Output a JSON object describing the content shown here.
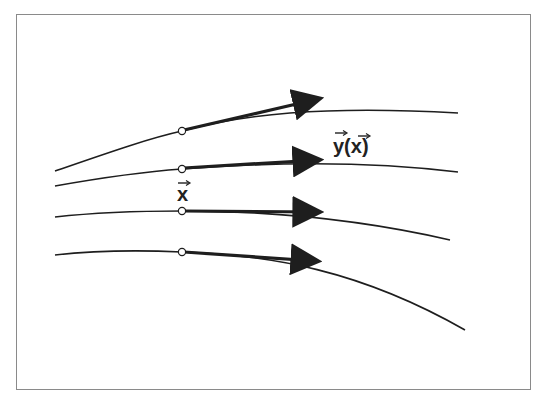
{
  "figure": {
    "labels": {
      "field_vector": "y(x)",
      "point": "x"
    },
    "colors": {
      "line": "#1e1e1e",
      "frame": "#8a8a8a",
      "background": "#ffffff"
    },
    "curves": [
      {
        "name": "curve-1",
        "path": "M55,171 C110,152 150,138 182,131 C240,115 320,105 458,113",
        "point": [
          182,
          131
        ],
        "arrow_tip": [
          334,
          96
        ]
      },
      {
        "name": "curve-2",
        "path": "M55,186 C100,178 140,172 182,169 C260,163 360,160 458,172",
        "point": [
          182,
          169
        ],
        "arrow_tip": [
          333,
          160
        ]
      },
      {
        "name": "curve-3",
        "path": "M55,217 C100,212 140,211 182,211 C260,211 350,217 450,240",
        "point": [
          182,
          211
        ],
        "arrow_tip": [
          333,
          212
        ]
      },
      {
        "name": "curve-4",
        "path": "M55,255 C100,250 140,250 182,252 C270,255 360,270 465,330",
        "point": [
          182,
          252
        ],
        "arrow_tip": [
          331,
          262
        ]
      }
    ]
  }
}
